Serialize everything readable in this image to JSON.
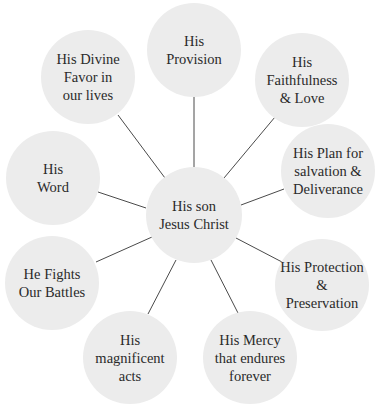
{
  "diagram": {
    "type": "hub-and-spoke",
    "colors": {
      "circle_fill": "#ececec",
      "line": "#4a4a4a",
      "text": "#2a2a2a",
      "background": "#ffffff"
    },
    "center": {
      "label": "His son\nJesus Christ"
    },
    "nodes": [
      {
        "id": "provision",
        "label": "His\nProvision"
      },
      {
        "id": "faithfulness",
        "label": "His\nFaithfulness\n& Love"
      },
      {
        "id": "plan",
        "label": "His Plan for\nsalvation &\nDeliverance"
      },
      {
        "id": "protection",
        "label": "His Protection\n& Preservation"
      },
      {
        "id": "mercy",
        "label": "His Mercy\nthat endures\nforever"
      },
      {
        "id": "magnificent",
        "label": "His\nmagnificent\nacts"
      },
      {
        "id": "fights",
        "label": "He Fights\nOur Battles"
      },
      {
        "id": "word",
        "label": "His\nWord"
      },
      {
        "id": "favor",
        "label": "His Divine\nFavor in\nour lives"
      }
    ]
  }
}
